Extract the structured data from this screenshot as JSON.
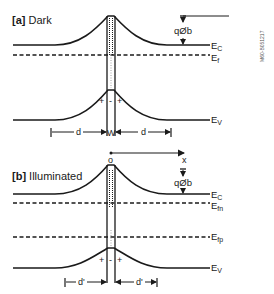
{
  "figure_code": "M60-B051217",
  "panel_a": {
    "tag": "[a]",
    "title": "Dark",
    "labels": {
      "ec": "E",
      "ec_sub": "C",
      "ef": "E",
      "ef_sub": "f",
      "ev": "E",
      "ev_sub": "V",
      "barrier": "qØb",
      "d_left": "d",
      "w": "W",
      "d_right": "d",
      "charges": [
        "+",
        "-",
        "+"
      ]
    }
  },
  "axis": {
    "origin": "o",
    "x": "x"
  },
  "panel_b": {
    "tag": "[b]",
    "title": "Illuminated",
    "labels": {
      "ec": "E",
      "ec_sub": "C",
      "efn": "E",
      "efn_sub": "fn",
      "efp": "E",
      "efp_sub": "fp",
      "ev": "E",
      "ev_sub": "V",
      "barrier": "qØb",
      "d_left": "d'",
      "d_right": "d'",
      "charges": [
        "+",
        "-",
        "+"
      ]
    }
  }
}
